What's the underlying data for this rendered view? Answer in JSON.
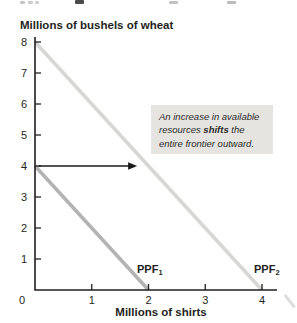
{
  "chart_data": {
    "type": "line",
    "title": "Millions of bushels of wheat",
    "xlabel": "Millions of shirts",
    "ylabel": "Millions of bushels of wheat",
    "xlim": [
      0,
      4.27
    ],
    "ylim": [
      0,
      8.2
    ],
    "xticks": [
      0,
      1,
      2,
      3,
      4
    ],
    "yticks": [
      1,
      2,
      3,
      4,
      5,
      6,
      7,
      8
    ],
    "grid": false,
    "axis_color": "#231f20",
    "series": [
      {
        "name": "PPF1",
        "label_base": "PPF",
        "label_sub": "1",
        "x": [
          0,
          2
        ],
        "y": [
          4,
          0
        ],
        "color": "#b3b3b3",
        "width": 3.6
      },
      {
        "name": "PPF2",
        "label_base": "PPF",
        "label_sub": "2",
        "x": [
          0,
          4
        ],
        "y": [
          8,
          0
        ],
        "color": "#d7d7d4",
        "width": 3.6
      }
    ],
    "arrow": {
      "from_xy": [
        0.06,
        4
      ],
      "to_xy": [
        1.8,
        4
      ],
      "color": "#1a1a1a"
    },
    "annotation": {
      "text_pre": "An increase in available resources ",
      "text_bold": "shifts",
      "text_post": " the entire frontier outward.",
      "bg": "#e6e4e1"
    }
  }
}
